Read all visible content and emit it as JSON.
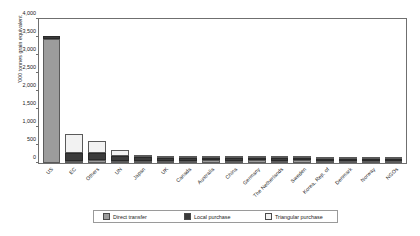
{
  "chart_data": {
    "type": "bar",
    "title": "",
    "subtitle": "",
    "xlabel": "",
    "ylabel": "'000 tonnes grain equivalent",
    "ylim": [
      0,
      4000
    ],
    "yticks": [
      0,
      500,
      1000,
      1500,
      2000,
      2500,
      3000,
      3500,
      4000
    ],
    "ytick_labels": [
      "0",
      "500",
      "1,000",
      "1,500",
      "2,000",
      "2,500",
      "3,000",
      "3,500",
      "4,000"
    ],
    "grid": false,
    "stacked": true,
    "legend_position": "bottom",
    "categories": [
      "US",
      "EC",
      "Others",
      "UN",
      "Japan",
      "UK",
      "Canada",
      "Australia",
      "China",
      "Germany",
      "The Netherlands",
      "Sweden",
      "Korea, Rep. of",
      "Denmark",
      "Norway",
      "NGOs"
    ],
    "series": [
      {
        "name": "Direct transfer",
        "color": "#9c9c9c",
        "values": [
          3400,
          60,
          90,
          55,
          60,
          45,
          60,
          75,
          40,
          95,
          55,
          80,
          40,
          35,
          30,
          20
        ]
      },
      {
        "name": "Local purchase",
        "color": "#3b3b3b",
        "values": [
          90,
          210,
          190,
          150,
          115,
          95,
          85,
          60,
          85,
          20,
          70,
          15,
          55,
          50,
          40,
          30
        ]
      },
      {
        "name": "Triangular purchase",
        "color": "#f2f2f2",
        "values": [
          0,
          520,
          310,
          145,
          25,
          20,
          15,
          10,
          10,
          5,
          5,
          5,
          5,
          5,
          5,
          5
        ]
      }
    ],
    "totals": [
      3490,
      790,
      590,
      350,
      200,
      160,
      160,
      145,
      135,
      120,
      130,
      100,
      100,
      90,
      75,
      55
    ]
  },
  "legend": {
    "items": [
      {
        "label": "Direct transfer",
        "swatch": "#9c9c9c"
      },
      {
        "label": "Local purchase",
        "swatch": "#3b3b3b"
      },
      {
        "label": "Triangular purchase",
        "swatch": "#f2f2f2"
      }
    ]
  },
  "colors": {
    "direct_transfer": "#9c9c9c",
    "local_purchase": "#3b3b3b",
    "triangular_purchase": "#f2f2f2",
    "axis": "#6f6f6f",
    "text": "#1a1a1a",
    "background": "#ffffff"
  }
}
